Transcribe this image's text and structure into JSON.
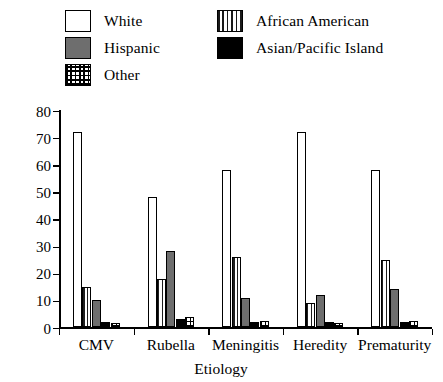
{
  "chart_data": {
    "type": "bar",
    "title": "",
    "xlabel": "Etiology",
    "ylabel": "Percent",
    "ylim": [
      0,
      80
    ],
    "yticks": [
      0,
      10,
      20,
      30,
      40,
      50,
      60,
      70,
      80
    ],
    "grid": false,
    "legend_position": "top",
    "categories": [
      "CMV",
      "Rubella",
      "Meningitis",
      "Heredity",
      "Prematurity"
    ],
    "series": [
      {
        "name": "White",
        "pattern": "open",
        "color": "#ffffff",
        "values": [
          72,
          48,
          58,
          72,
          58
        ]
      },
      {
        "name": "African American",
        "pattern": "vertical-stripes",
        "color": "#1f1f1f",
        "values": [
          15,
          18,
          26,
          9,
          25
        ]
      },
      {
        "name": "Hispanic",
        "pattern": "solid-gray",
        "color": "#6e6e6e",
        "values": [
          10,
          28,
          11,
          12,
          14
        ]
      },
      {
        "name": "Asian/Pacific Island",
        "pattern": "solid-black",
        "color": "#000000",
        "values": [
          2,
          3,
          2,
          2,
          2
        ]
      },
      {
        "name": "Other",
        "pattern": "crosshatch",
        "color": "#000000",
        "values": [
          1.5,
          4,
          2.5,
          1.5,
          2.5
        ]
      }
    ]
  },
  "legend": {
    "items": [
      {
        "label": "White",
        "swatch": "white-swatch"
      },
      {
        "label": "African American",
        "swatch": "vertical-stripe-swatch"
      },
      {
        "label": "Hispanic",
        "swatch": "gray-swatch"
      },
      {
        "label": "Asian/Pacific Island",
        "swatch": "black-swatch"
      },
      {
        "label": "Other",
        "swatch": "crosshatch-swatch"
      }
    ]
  },
  "axes": {
    "y_title": "Percent",
    "x_title": "Etiology",
    "y_tick_labels": [
      "0",
      "10",
      "20",
      "30",
      "40",
      "50",
      "60",
      "70",
      "80"
    ],
    "x_tick_labels": [
      "CMV",
      "Rubella",
      "Meningitis",
      "Heredity",
      "Prematurity"
    ]
  }
}
